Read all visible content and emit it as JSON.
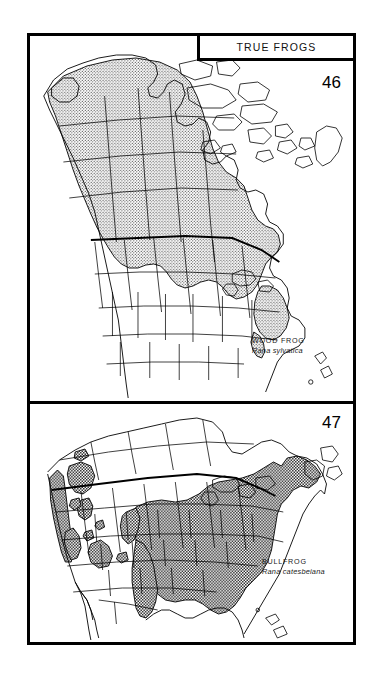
{
  "plate": {
    "title": "TRUE FROGS",
    "background_color": "#ffffff",
    "ink_color": "#000000"
  },
  "panels": [
    {
      "id": "wood-frog",
      "plate_number": "46",
      "common_name": "WOOD FROG",
      "scientific_name": "Rana sylvatica",
      "map_subject": "North America",
      "range_shading": "light stipple",
      "range_fill_color": "#c9c9c9"
    },
    {
      "id": "bullfrog",
      "plate_number": "47",
      "common_name": "BULLFROG",
      "scientific_name": "Rana catesbeiana",
      "map_subject": "United States and southern Canada",
      "range_shading": "dark crosshatch",
      "range_fill_color": "#8a8a8a"
    }
  ]
}
